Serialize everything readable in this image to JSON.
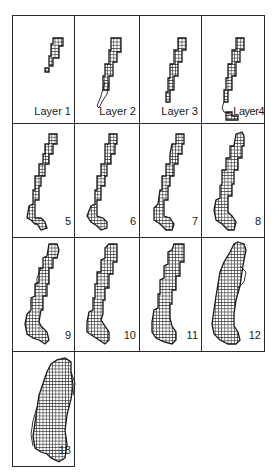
{
  "figure": {
    "colors": {
      "ink": "#1a1a1a",
      "grid": "#2a2a2a",
      "background": "#ffffff"
    },
    "panels": [
      {
        "id": 1,
        "label": "Layer 1",
        "row": 0,
        "col": 0
      },
      {
        "id": 2,
        "label": "Layer 2",
        "row": 0,
        "col": 1
      },
      {
        "id": 3,
        "label": "Layer 3",
        "row": 0,
        "col": 2
      },
      {
        "id": 4,
        "label": "Layer4",
        "row": 0,
        "col": 3
      },
      {
        "id": 5,
        "label": "5",
        "row": 1,
        "col": 0
      },
      {
        "id": 6,
        "label": "6",
        "row": 1,
        "col": 1
      },
      {
        "id": 7,
        "label": "7",
        "row": 1,
        "col": 2
      },
      {
        "id": 8,
        "label": "8",
        "row": 1,
        "col": 3
      },
      {
        "id": 9,
        "label": "9",
        "row": 2,
        "col": 0
      },
      {
        "id": 10,
        "label": "10",
        "row": 2,
        "col": 1
      },
      {
        "id": 11,
        "label": "11",
        "row": 2,
        "col": 2
      },
      {
        "id": 12,
        "label": "12",
        "row": 2,
        "col": 3
      },
      {
        "id": 13,
        "label": "13",
        "row": 3,
        "col": 0
      }
    ]
  }
}
